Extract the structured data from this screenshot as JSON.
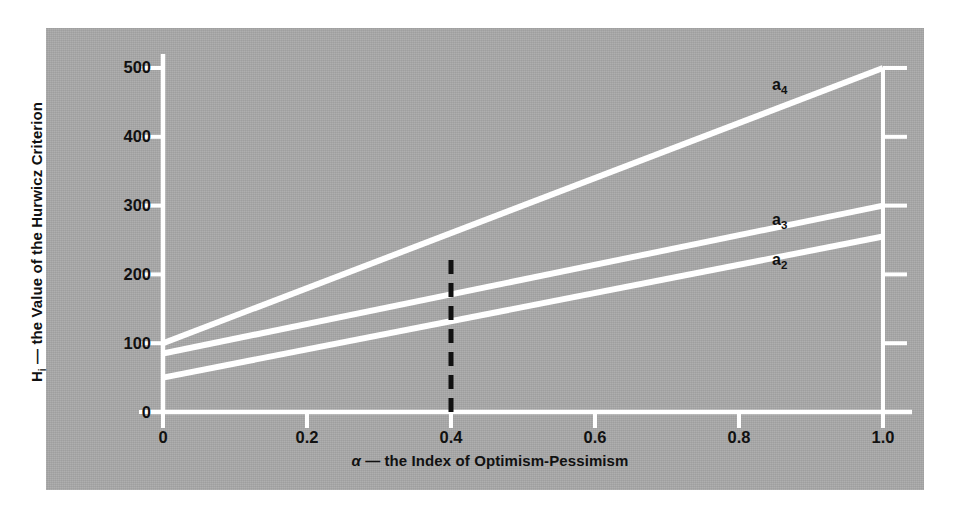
{
  "figure": {
    "panel_color": "#a9a9a9",
    "line_color": "#ffffff",
    "text_color": "#111111",
    "marker_color": "#111111"
  },
  "chart_data": {
    "type": "line",
    "title": "",
    "xlabel": "α — the Index of Optimism-Pessimism",
    "ylabel": "Hᵢ — the Value of the Hurwicz Criterion",
    "xlim": [
      0,
      1.0
    ],
    "ylim": [
      0,
      500
    ],
    "grid": false,
    "legend": "inline-right",
    "x": [
      0,
      1.0
    ],
    "xticks": [
      0,
      0.2,
      0.4,
      0.6,
      0.8,
      1.0
    ],
    "xticklabels": [
      "0",
      "0.2",
      "0.4",
      "0.6",
      "0.8",
      "1.0"
    ],
    "yticks": [
      0,
      100,
      200,
      300,
      400,
      500
    ],
    "yticklabels": [
      "0",
      "100",
      "200",
      "300",
      "400",
      "500"
    ],
    "series": [
      {
        "name": "a4",
        "label": "a",
        "sub": "4",
        "values": [
          100,
          500
        ]
      },
      {
        "name": "a3",
        "label": "a",
        "sub": "3",
        "values": [
          85,
          300
        ]
      },
      {
        "name": "a2",
        "label": "a",
        "sub": "2",
        "values": [
          50,
          255
        ]
      }
    ],
    "annotations": [
      {
        "name": "alpha-marker",
        "type": "vertical-dashed-line",
        "x": 0.4,
        "y_from": 0,
        "y_to": 225,
        "color": "#111111"
      }
    ]
  },
  "ylabel_parts": {
    "symbol": "H",
    "subscript": "i",
    "rest": " — the Value of the Hurwicz Criterion"
  },
  "xlabel_parts": {
    "symbol": "α",
    "rest": " — the Index of Optimism-Pessimism"
  }
}
